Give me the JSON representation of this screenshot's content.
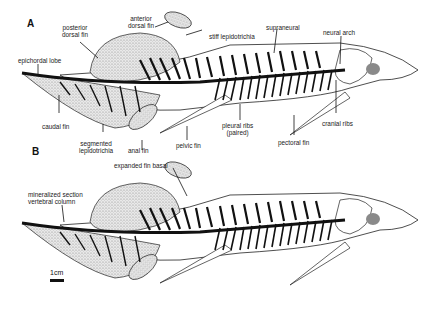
{
  "figure": {
    "panels": [
      {
        "letter": "A",
        "labels": {
          "posterior_dorsal_fin_1": "posterior",
          "posterior_dorsal_fin_2": "dorsal fin",
          "anterior_dorsal_fin_1": "anterior",
          "anterior_dorsal_fin_2": "dorsal fin",
          "stiff_lepidotrichia": "stiff lepidotrichia",
          "supraneural": "supraneural",
          "neural_arch": "neural arch",
          "epichordal_lobe": "epichordal lobe",
          "caudal_fin": "caudal fin",
          "segmented_lepidotrichia_1": "segmented",
          "segmented_lepidotrichia_2": "lepidotrichia",
          "anal_fin": "anal fin",
          "pelvic_fin": "pelvic fin",
          "pleural_ribs_1": "pleural ribs",
          "pleural_ribs_2": "(paired)",
          "pectoral_fin": "pectoral fin",
          "cranial_ribs": "cranial ribs"
        }
      },
      {
        "letter": "B",
        "labels": {
          "expanded_fin_basal": "expanded fin basal",
          "mineralized_section": "mineralized section",
          "vertebral_column": "vertebral column"
        },
        "scale_bar": "1cm"
      }
    ],
    "colors": {
      "ink": "#111111",
      "eye": "#8a8a8a",
      "stipple": "#bdbdbd"
    }
  }
}
